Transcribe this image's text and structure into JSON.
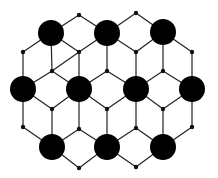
{
  "diagram": {
    "type": "hexagonal-lattice",
    "large_node_radius": 13,
    "small_node_radius": 2.2,
    "colors": {
      "node": "#000000",
      "edge": "#222222",
      "background": "#ffffff"
    },
    "large_nodes": [
      [
        51,
        33
      ],
      [
        107,
        33
      ],
      [
        163,
        32
      ],
      [
        23,
        89
      ],
      [
        79,
        89
      ],
      [
        136,
        89
      ],
      [
        192,
        89
      ],
      [
        52,
        147
      ],
      [
        107,
        147
      ],
      [
        163,
        147
      ]
    ],
    "small_nodes": [
      [
        79,
        15
      ],
      [
        136,
        13
      ],
      [
        23,
        52
      ],
      [
        79,
        52
      ],
      [
        136,
        52
      ],
      [
        192,
        52
      ],
      [
        52,
        71
      ],
      [
        107,
        71
      ],
      [
        163,
        71
      ],
      [
        52,
        109
      ],
      [
        107,
        109
      ],
      [
        163,
        109
      ],
      [
        23,
        127
      ],
      [
        79,
        129
      ],
      [
        136,
        128
      ],
      [
        192,
        127
      ],
      [
        79,
        168
      ],
      [
        136,
        167
      ]
    ],
    "edges": [
      [
        [
          51,
          33
        ],
        [
          79,
          15
        ]
      ],
      [
        [
          79,
          15
        ],
        [
          107,
          33
        ]
      ],
      [
        [
          107,
          33
        ],
        [
          136,
          13
        ]
      ],
      [
        [
          136,
          13
        ],
        [
          163,
          32
        ]
      ],
      [
        [
          51,
          33
        ],
        [
          23,
          52
        ]
      ],
      [
        [
          51,
          33
        ],
        [
          79,
          52
        ]
      ],
      [
        [
          107,
          33
        ],
        [
          79,
          52
        ]
      ],
      [
        [
          107,
          33
        ],
        [
          136,
          52
        ]
      ],
      [
        [
          163,
          32
        ],
        [
          136,
          52
        ]
      ],
      [
        [
          163,
          32
        ],
        [
          192,
          52
        ]
      ],
      [
        [
          23,
          52
        ],
        [
          23,
          89
        ]
      ],
      [
        [
          51,
          33
        ],
        [
          52,
          71
        ]
      ],
      [
        [
          79,
          52
        ],
        [
          79,
          89
        ]
      ],
      [
        [
          107,
          33
        ],
        [
          107,
          71
        ]
      ],
      [
        [
          136,
          52
        ],
        [
          136,
          89
        ]
      ],
      [
        [
          163,
          32
        ],
        [
          163,
          71
        ]
      ],
      [
        [
          192,
          52
        ],
        [
          192,
          89
        ]
      ],
      [
        [
          79,
          52
        ],
        [
          52,
          71
        ]
      ],
      [
        [
          52,
          71
        ],
        [
          23,
          89
        ]
      ],
      [
        [
          52,
          71
        ],
        [
          79,
          89
        ]
      ],
      [
        [
          107,
          71
        ],
        [
          79,
          89
        ]
      ],
      [
        [
          107,
          71
        ],
        [
          136,
          89
        ]
      ],
      [
        [
          163,
          71
        ],
        [
          136,
          89
        ]
      ],
      [
        [
          163,
          71
        ],
        [
          192,
          89
        ]
      ],
      [
        [
          23,
          89
        ],
        [
          52,
          109
        ]
      ],
      [
        [
          79,
          89
        ],
        [
          52,
          109
        ]
      ],
      [
        [
          79,
          89
        ],
        [
          107,
          109
        ]
      ],
      [
        [
          136,
          89
        ],
        [
          107,
          109
        ]
      ],
      [
        [
          136,
          89
        ],
        [
          163,
          109
        ]
      ],
      [
        [
          192,
          89
        ],
        [
          163,
          109
        ]
      ],
      [
        [
          23,
          89
        ],
        [
          23,
          127
        ]
      ],
      [
        [
          52,
          109
        ],
        [
          52,
          147
        ]
      ],
      [
        [
          79,
          89
        ],
        [
          79,
          129
        ]
      ],
      [
        [
          107,
          109
        ],
        [
          107,
          147
        ]
      ],
      [
        [
          136,
          89
        ],
        [
          136,
          128
        ]
      ],
      [
        [
          163,
          109
        ],
        [
          163,
          147
        ]
      ],
      [
        [
          192,
          89
        ],
        [
          192,
          127
        ]
      ],
      [
        [
          23,
          127
        ],
        [
          52,
          147
        ]
      ],
      [
        [
          79,
          129
        ],
        [
          52,
          147
        ]
      ],
      [
        [
          79,
          129
        ],
        [
          107,
          147
        ]
      ],
      [
        [
          136,
          128
        ],
        [
          107,
          147
        ]
      ],
      [
        [
          136,
          128
        ],
        [
          163,
          147
        ]
      ],
      [
        [
          192,
          127
        ],
        [
          163,
          147
        ]
      ],
      [
        [
          52,
          147
        ],
        [
          79,
          168
        ]
      ],
      [
        [
          79,
          168
        ],
        [
          107,
          147
        ]
      ],
      [
        [
          107,
          147
        ],
        [
          136,
          167
        ]
      ],
      [
        [
          136,
          167
        ],
        [
          163,
          147
        ]
      ]
    ]
  }
}
